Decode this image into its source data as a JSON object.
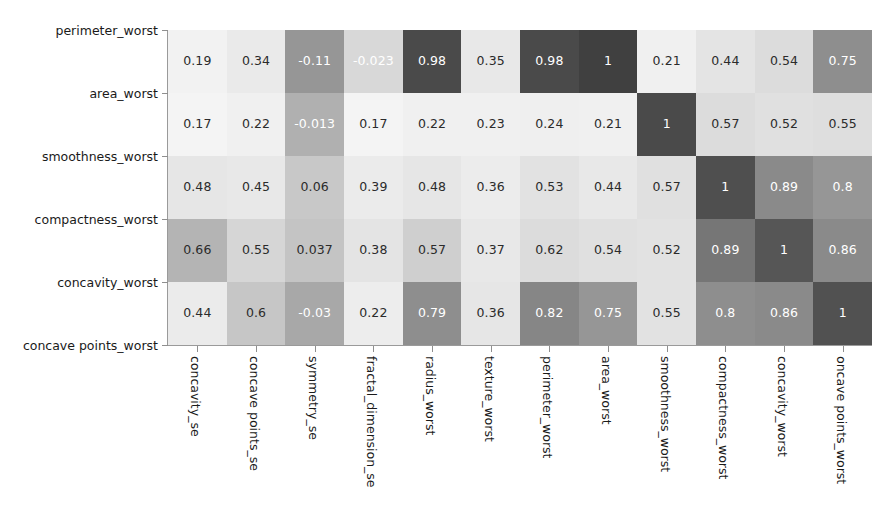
{
  "chart_data": {
    "type": "heatmap",
    "title": "",
    "xlabel": "",
    "ylabel": "",
    "colormap": "grayscale",
    "grid": false,
    "legend": "none",
    "value_range": [
      -0.11,
      1
    ],
    "x_tick_labels": [
      "concavity_se",
      "concave points_se",
      "symmetry_se",
      "fractal_dimension_se",
      "radius_worst",
      "texture_worst",
      "perimeter_worst",
      "area_worst",
      "smoothness_worst",
      "compactness_worst",
      "concavity_worst",
      "oncave points_worst"
    ],
    "y_tick_labels": [
      "perimeter_worst",
      "area_worst",
      "smoothness_worst",
      "compactness_worst",
      "concavity_worst",
      "concave points_worst"
    ],
    "row_labels": [
      "perimeter_worst",
      "area_worst",
      "smoothness_worst",
      "compactness_worst",
      "concavity_worst"
    ],
    "columns": [
      "concavity_se",
      "concave points_se",
      "symmetry_se",
      "fractal_dimension_se",
      "radius_worst",
      "texture_worst",
      "perimeter_worst",
      "area_worst",
      "smoothness_worst",
      "compactness_worst",
      "concavity_worst",
      "oncave points_worst"
    ],
    "rows": [
      {
        "label": "perimeter_worst",
        "values": [
          0.19,
          0.34,
          -0.11,
          -0.023,
          0.98,
          0.35,
          0.98,
          1,
          0.21,
          0.44,
          0.54,
          0.75
        ],
        "display": [
          "0.19",
          "0.34",
          "-0.11",
          "-0.023",
          "0.98",
          "0.35",
          "0.98",
          "1",
          "0.21",
          "0.44",
          "0.54",
          "0.75"
        ],
        "shades": [
          "#f2f2f2",
          "#eaeaea",
          "#969696",
          "#d8d8d8",
          "#4a4a4a",
          "#e8e8e8",
          "#4a4a4a",
          "#404040",
          "#f0f0f0",
          "#e4e4e4",
          "#dcdcdc",
          "#8e8e8e"
        ],
        "ink": [
          "#2b2b2b",
          "#2b2b2b",
          "#ffffff",
          "#ffffff",
          "#ffffff",
          "#2b2b2b",
          "#ffffff",
          "#ffffff",
          "#2b2b2b",
          "#2b2b2b",
          "#2b2b2b",
          "#ffffff"
        ]
      },
      {
        "label": "area_worst",
        "values": [
          0.17,
          0.22,
          -0.013,
          0.17,
          0.22,
          0.23,
          0.24,
          0.21,
          1,
          0.57,
          0.52,
          0.55
        ],
        "display": [
          "0.17",
          "0.22",
          "-0.013",
          "0.17",
          "0.22",
          "0.23",
          "0.24",
          "0.21",
          "1",
          "0.57",
          "0.52",
          "0.55"
        ],
        "shades": [
          "#f4f4f4",
          "#f0f0f0",
          "#b0b0b0",
          "#f4f4f4",
          "#f0f0f0",
          "#f0f0f0",
          "#efefef",
          "#f0f0f0",
          "#4a4a4a",
          "#dcdcdc",
          "#e0e0e0",
          "#dedede"
        ],
        "ink": [
          "#2b2b2b",
          "#2b2b2b",
          "#ffffff",
          "#2b2b2b",
          "#2b2b2b",
          "#2b2b2b",
          "#2b2b2b",
          "#2b2b2b",
          "#ffffff",
          "#2b2b2b",
          "#2b2b2b",
          "#2b2b2b"
        ]
      },
      {
        "label": "smoothness_worst",
        "values": [
          0.48,
          0.45,
          0.06,
          0.39,
          0.48,
          0.36,
          0.53,
          0.44,
          0.57,
          1,
          0.89,
          0.8
        ],
        "display": [
          "0.48",
          "0.45",
          "0.06",
          "0.39",
          "0.48",
          "0.36",
          "0.53",
          "0.44",
          "0.57",
          "1",
          "0.89",
          "0.8"
        ],
        "shades": [
          "#e6e6e6",
          "#e8e8e8",
          "#c8c8c8",
          "#ebebeb",
          "#e6e6e6",
          "#ececec",
          "#e2e2e2",
          "#e8e8e8",
          "#e0e0e0",
          "#4f4f4f",
          "#8a8a8a",
          "#969696"
        ],
        "ink": [
          "#2b2b2b",
          "#2b2b2b",
          "#2b2b2b",
          "#2b2b2b",
          "#2b2b2b",
          "#2b2b2b",
          "#2b2b2b",
          "#2b2b2b",
          "#2b2b2b",
          "#ffffff",
          "#ffffff",
          "#ffffff"
        ]
      },
      {
        "label": "compactness_worst",
        "values": [
          0.66,
          0.55,
          0.037,
          0.38,
          0.57,
          0.37,
          0.62,
          0.54,
          0.52,
          0.89,
          1,
          0.86
        ],
        "display": [
          "0.66",
          "0.55",
          "0.037",
          "0.38",
          "0.57",
          "0.37",
          "0.62",
          "0.54",
          "0.52",
          "0.89",
          "1",
          "0.86"
        ],
        "shades": [
          "#b4b4b4",
          "#d6d6d6",
          "#c4c4c4",
          "#e4e4e4",
          "#cfcfcf",
          "#e8e8e8",
          "#dcdcdc",
          "#e0e0e0",
          "#e2e2e2",
          "#767676",
          "#565656",
          "#8a8a8a"
        ],
        "ink": [
          "#2b2b2b",
          "#2b2b2b",
          "#2b2b2b",
          "#2b2b2b",
          "#2b2b2b",
          "#2b2b2b",
          "#2b2b2b",
          "#2b2b2b",
          "#2b2b2b",
          "#ffffff",
          "#ffffff",
          "#ffffff"
        ]
      },
      {
        "label": "concavity_worst",
        "values": [
          0.44,
          0.6,
          -0.03,
          0.22,
          0.79,
          0.36,
          0.82,
          0.75,
          0.55,
          0.8,
          0.86,
          1
        ],
        "display": [
          "0.44",
          "0.6",
          "-0.03",
          "0.22",
          "0.79",
          "0.36",
          "0.82",
          "0.75",
          "0.55",
          "0.8",
          "0.86",
          "1"
        ],
        "shades": [
          "#ebebeb",
          "#c6c6c6",
          "#a8a8a8",
          "#ededed",
          "#8e8e8e",
          "#e6e6e6",
          "#868686",
          "#969696",
          "#e2e2e2",
          "#8e8e8e",
          "#8a8a8a",
          "#515151"
        ],
        "ink": [
          "#2b2b2b",
          "#2b2b2b",
          "#ffffff",
          "#2b2b2b",
          "#ffffff",
          "#2b2b2b",
          "#ffffff",
          "#ffffff",
          "#2b2b2b",
          "#ffffff",
          "#ffffff",
          "#ffffff"
        ]
      }
    ]
  },
  "axes": {
    "y_tick_positions_px": [
      30,
      93,
      156,
      219,
      282,
      345
    ],
    "plot": {
      "left": 168,
      "top": 30,
      "width": 704,
      "height": 315,
      "cols": 12,
      "rows": 5
    }
  }
}
